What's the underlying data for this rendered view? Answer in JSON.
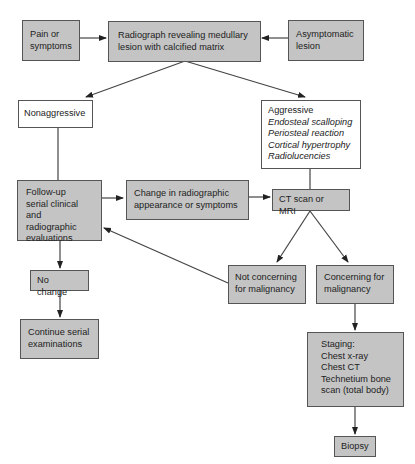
{
  "nodes": {
    "pain": {
      "lines": [
        "Pain or",
        "symptoms"
      ]
    },
    "radiograph": {
      "lines": [
        "Radiograph revealing medullary",
        "lesion with calcified matrix"
      ]
    },
    "asymptomatic": {
      "lines": [
        "Asymptomatic",
        "lesion"
      ]
    },
    "nonaggressive": {
      "lines": [
        "Nonaggressive"
      ]
    },
    "aggressive": {
      "title": "Aggressive",
      "features": [
        "Endosteal scalloping",
        "Periosteal reaction",
        "Cortical hypertrophy",
        "Radiolucencies"
      ]
    },
    "followup": {
      "lines": [
        "Follow-up",
        "serial clinical",
        "and radiographic",
        "evaluations"
      ]
    },
    "change": {
      "lines": [
        "Change in radiographic",
        "appearance or symptoms"
      ]
    },
    "ct_mri": {
      "lines": [
        "CT scan or MRI"
      ]
    },
    "no_change": {
      "lines": [
        "No change"
      ]
    },
    "continue": {
      "lines": [
        "Continue serial",
        "examinations"
      ]
    },
    "not_concerning": {
      "lines": [
        "Not concerning",
        "for malignancy"
      ]
    },
    "concerning": {
      "lines": [
        "Concerning for",
        "malignancy"
      ]
    },
    "staging": {
      "lines": [
        "Staging:",
        "Chest x-ray",
        "Chest CT",
        "Technetium bone",
        "scan (total body)"
      ]
    },
    "biopsy": {
      "lines": [
        "Biopsy"
      ]
    }
  },
  "edges": [
    {
      "from": "pain",
      "to": "radiograph"
    },
    {
      "from": "asymptomatic",
      "to": "radiograph"
    },
    {
      "from": "radiograph",
      "to": "nonaggressive"
    },
    {
      "from": "radiograph",
      "to": "aggressive"
    },
    {
      "from": "nonaggressive",
      "to": "followup"
    },
    {
      "from": "followup",
      "to": "change"
    },
    {
      "from": "change",
      "to": "ct_mri"
    },
    {
      "from": "aggressive",
      "to": "ct_mri"
    },
    {
      "from": "ct_mri",
      "to": "not_concerning"
    },
    {
      "from": "ct_mri",
      "to": "concerning"
    },
    {
      "from": "not_concerning",
      "to": "followup"
    },
    {
      "from": "followup",
      "to": "no_change"
    },
    {
      "from": "no_change",
      "to": "continue"
    },
    {
      "from": "concerning",
      "to": "staging"
    },
    {
      "from": "staging",
      "to": "biopsy"
    }
  ],
  "colors": {
    "gray_fill": "#c4c4c4",
    "white_fill": "#ffffff",
    "stroke": "#444444"
  }
}
